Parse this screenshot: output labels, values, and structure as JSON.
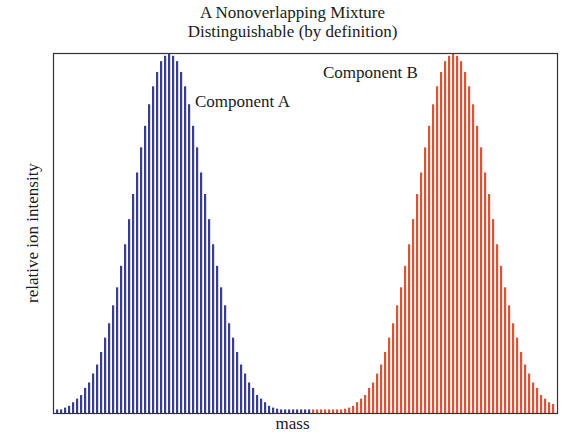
{
  "chart_data": {
    "type": "bar",
    "title": "A Nonoverlapping Mixture",
    "subtitle": "Distinguishable (by definition)",
    "xlabel": "mass",
    "ylabel": "relative ion intensity",
    "ylim": [
      0,
      100
    ],
    "grid": false,
    "legend": "none",
    "annotations": [
      {
        "text": "Component A",
        "near": "peak of series A"
      },
      {
        "text": "Component B",
        "near": "peak of series B"
      }
    ],
    "bar_spacing_px": 4,
    "x_start_px": 57,
    "series": [
      {
        "name": "Component A",
        "color": "#3b3d8c",
        "start_index": 0,
        "values": [
          1,
          1,
          1.5,
          2,
          3,
          4,
          5,
          7,
          8.5,
          11,
          13.5,
          17,
          21,
          25,
          30,
          35,
          41,
          47,
          54,
          61,
          67,
          74,
          80,
          86,
          91,
          95,
          98,
          99.5,
          100,
          99.5,
          98,
          95,
          91,
          86,
          80,
          74,
          67,
          61,
          54,
          47,
          41,
          35,
          30,
          25,
          21,
          17,
          13.5,
          11,
          8.5,
          7,
          5,
          4,
          3,
          2,
          1.5,
          1.2,
          1,
          1,
          1,
          1,
          1,
          1,
          1,
          1
        ]
      },
      {
        "name": "Component B",
        "color": "#d8553a",
        "start_index": 64,
        "values": [
          1,
          1,
          1,
          1,
          1,
          1,
          1,
          1,
          1.2,
          1.5,
          2,
          3,
          4,
          5,
          7,
          8.5,
          11,
          13.5,
          17,
          21,
          25,
          30,
          35,
          41,
          47,
          54,
          61,
          67,
          74,
          80,
          86,
          91,
          95,
          98,
          99.5,
          100,
          99.5,
          98,
          95,
          91,
          86,
          80,
          74,
          67,
          61,
          54,
          47,
          41,
          35,
          30,
          25,
          21,
          17,
          13.5,
          11,
          8.5,
          7,
          5,
          4,
          3,
          2.5
        ]
      }
    ]
  },
  "labels": {
    "title_line1": "A Nonoverlapping Mixture",
    "title_line2": "Distinguishable (by definition)",
    "xlabel": "mass",
    "ylabel": "relative ion intensity",
    "component_a": "Component A",
    "component_b": "Component B"
  }
}
